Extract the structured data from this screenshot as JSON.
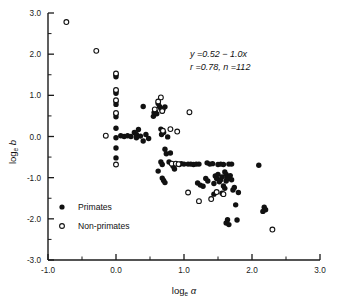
{
  "figure": {
    "background": "#ffffff",
    "foreground": "#111111"
  },
  "annotation": {
    "equation": "y =0.52 − 1.0x",
    "stats": "r =0.78, n =112"
  },
  "legend": {
    "entries": [
      {
        "label": "Primates",
        "marker": "filled-circle"
      },
      {
        "label": "Non-primates",
        "marker": "open-circle"
      }
    ]
  },
  "axes": {
    "x": {
      "label_base": "log",
      "label_sub": "e",
      "label_var": "α",
      "ticks": [
        "-1.0",
        "0.0",
        "1.0",
        "2.0",
        "3.0"
      ],
      "tick_values": [
        -1.0,
        0.0,
        1.0,
        2.0,
        3.0
      ],
      "minor_values": [
        -0.5,
        0.5,
        1.5,
        2.5
      ],
      "range": [
        -1.0,
        3.0
      ]
    },
    "y": {
      "label_base": "log",
      "label_sub": "e",
      "label_var": "b",
      "ticks": [
        "3.0",
        "2.0",
        "1.0",
        "0.0",
        "-1.0",
        "-2.0",
        "-3.0"
      ],
      "tick_values": [
        3.0,
        2.0,
        1.0,
        0.0,
        -1.0,
        -2.0,
        -3.0
      ],
      "minor_values": [
        2.5,
        1.5,
        0.5,
        -0.5,
        -1.5,
        -2.5
      ],
      "range": [
        -3.0,
        3.0
      ]
    }
  },
  "chart_data": {
    "type": "scatter",
    "title": "",
    "xlabel": "log_e α",
    "ylabel": "log_e b",
    "xlim": [
      -1.0,
      3.0
    ],
    "ylim": [
      -3.0,
      3.0
    ],
    "grid": false,
    "legend_position": "lower-left",
    "annotations": [
      "y =0.52 − 1.0x",
      "r =0.78, n =112"
    ],
    "fit": {
      "intercept": 0.52,
      "slope": -1.0,
      "r": 0.78,
      "n": 112,
      "line_drawn": false
    },
    "series": [
      {
        "name": "Primates",
        "marker": "filled-circle",
        "points": [
          [
            0.0,
            1.5
          ],
          [
            0.0,
            1.45
          ],
          [
            0.0,
            1.1
          ],
          [
            0.0,
            1.05
          ],
          [
            0.0,
            0.85
          ],
          [
            0.0,
            0.78
          ],
          [
            0.0,
            0.55
          ],
          [
            0.0,
            0.48
          ],
          [
            0.0,
            0.2
          ],
          [
            0.0,
            -0.03
          ],
          [
            0.0,
            -0.28
          ],
          [
            0.0,
            -0.52
          ],
          [
            0.07,
            0.02
          ],
          [
            0.12,
            0.0
          ],
          [
            0.17,
            0.02
          ],
          [
            0.22,
            0.0
          ],
          [
            0.27,
            0.1
          ],
          [
            0.3,
            0.05
          ],
          [
            0.33,
            0.17
          ],
          [
            0.3,
            -0.03
          ],
          [
            0.36,
            0.01
          ],
          [
            0.4,
            -0.11
          ],
          [
            0.4,
            0.73
          ],
          [
            0.55,
            0.49
          ],
          [
            0.56,
            0.58
          ],
          [
            0.62,
            0.8
          ],
          [
            0.64,
            0.73
          ],
          [
            0.66,
            0.68
          ],
          [
            0.68,
            0.62
          ],
          [
            0.69,
            0.66
          ],
          [
            0.72,
            0.72
          ],
          [
            0.66,
            0.18
          ],
          [
            0.67,
            0.05
          ],
          [
            0.7,
            0.1
          ],
          [
            0.76,
            -0.01
          ],
          [
            0.72,
            -0.31
          ],
          [
            0.74,
            -0.42
          ],
          [
            0.66,
            -0.62
          ],
          [
            0.68,
            -0.68
          ],
          [
            0.62,
            -0.84
          ],
          [
            0.68,
            -1.01
          ],
          [
            0.7,
            -1.07
          ],
          [
            0.72,
            -1.12
          ],
          [
            0.8,
            -0.4
          ],
          [
            0.84,
            -0.72
          ],
          [
            0.86,
            -0.79
          ],
          [
            0.88,
            -0.66
          ],
          [
            0.93,
            -0.68
          ],
          [
            1.06,
            -0.67
          ],
          [
            1.1,
            -0.67
          ],
          [
            1.14,
            -0.68
          ],
          [
            1.18,
            -0.67
          ],
          [
            1.22,
            -0.67
          ],
          [
            1.2,
            -1.13
          ],
          [
            1.24,
            -1.18
          ],
          [
            1.32,
            -1.02
          ],
          [
            1.35,
            -1.08
          ],
          [
            1.38,
            -0.67
          ],
          [
            1.42,
            -0.66
          ],
          [
            1.46,
            -0.96
          ],
          [
            1.48,
            -1.02
          ],
          [
            1.5,
            -0.92
          ],
          [
            1.52,
            -1.1
          ],
          [
            1.54,
            -1.05
          ],
          [
            1.56,
            -0.98
          ],
          [
            1.5,
            -0.68
          ],
          [
            1.54,
            -0.67
          ],
          [
            1.58,
            -0.68
          ],
          [
            1.6,
            -0.86
          ],
          [
            1.62,
            -0.92
          ],
          [
            1.63,
            -1.0
          ],
          [
            1.58,
            -1.2
          ],
          [
            1.6,
            -1.26
          ],
          [
            1.62,
            -1.08
          ],
          [
            1.65,
            -1.02
          ],
          [
            1.66,
            -0.67
          ],
          [
            1.7,
            -0.67
          ],
          [
            1.68,
            -0.95
          ],
          [
            1.7,
            -1.05
          ],
          [
            1.72,
            -1.3
          ],
          [
            1.74,
            -1.24
          ],
          [
            1.64,
            -2.02
          ],
          [
            1.62,
            -2.1
          ],
          [
            1.66,
            -2.14
          ],
          [
            1.78,
            -2.03
          ],
          [
            1.76,
            -1.66
          ],
          [
            1.8,
            -1.36
          ],
          [
            2.1,
            -0.7
          ],
          [
            2.18,
            -1.72
          ],
          [
            2.2,
            -1.78
          ],
          [
            2.16,
            -1.82
          ],
          [
            0.44,
            0.05
          ],
          [
            0.48,
            -0.05
          ],
          [
            0.58,
            0.6
          ],
          [
            0.6,
            0.55
          ],
          [
            0.78,
            -0.62
          ],
          [
            0.96,
            -0.66
          ],
          [
            1.0,
            -0.67
          ],
          [
            1.28,
            -1.21
          ],
          [
            1.44,
            -1.14
          ],
          [
            1.34,
            -0.64
          ],
          [
            1.56,
            -1.38
          ],
          [
            1.44,
            -1.4
          ]
        ]
      },
      {
        "name": "Non-primates",
        "marker": "open-circle",
        "points": [
          [
            -0.73,
            2.78
          ],
          [
            -0.29,
            2.08
          ],
          [
            0.0,
            1.53
          ],
          [
            0.0,
            1.13
          ],
          [
            0.0,
            0.88
          ],
          [
            0.0,
            0.57
          ],
          [
            0.0,
            -0.68
          ],
          [
            -0.15,
            0.02
          ],
          [
            0.66,
            0.95
          ],
          [
            0.62,
            0.85
          ],
          [
            0.57,
            0.66
          ],
          [
            0.68,
            0.62
          ],
          [
            0.69,
            0.14
          ],
          [
            0.8,
            0.18
          ],
          [
            0.9,
            0.12
          ],
          [
            0.82,
            -0.66
          ],
          [
            0.88,
            -0.66
          ],
          [
            0.92,
            -0.67
          ],
          [
            1.08,
            0.59
          ],
          [
            1.06,
            -1.36
          ],
          [
            1.22,
            -1.57
          ],
          [
            1.48,
            -1.35
          ],
          [
            1.4,
            -1.52
          ],
          [
            1.58,
            -1.4
          ],
          [
            2.3,
            -2.26
          ]
        ]
      }
    ]
  }
}
